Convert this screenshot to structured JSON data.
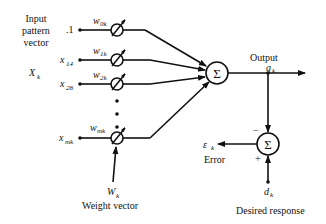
{
  "diagram": {
    "input_label": [
      "Input",
      "pattern",
      "vector"
    ],
    "input_vector_symbol": "X",
    "input_vector_sub": "k",
    "inputs": [
      {
        "label": ".1",
        "sub": "",
        "weight": "w",
        "weight_sub": "0k"
      },
      {
        "label": "x",
        "sub": "14",
        "weight": "w",
        "weight_sub": "1k"
      },
      {
        "label": "x",
        "sub": "28",
        "weight": "w",
        "weight_sub": "2k"
      },
      {
        "label": "x",
        "sub": "mk",
        "weight": "w",
        "weight_sub": "mk"
      }
    ],
    "weight_vector_symbol": "W",
    "weight_vector_sub": "k",
    "weight_vector_label": "Weight vector",
    "sum_symbol": "Σ",
    "output_label": "Output",
    "output_symbol": "g",
    "output_sub": "k",
    "error_symbol": "ε",
    "error_sub": "k",
    "error_label": "Error",
    "minus_sign": "−",
    "plus_sign": "+",
    "desired_symbol": "d",
    "desired_sub": "k",
    "desired_label": "Desired response"
  }
}
